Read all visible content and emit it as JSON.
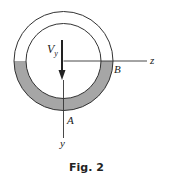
{
  "figure": {
    "caption": "Fig. 2",
    "shear_force_label": "V",
    "shear_force_subscript": "y",
    "axis_z_label": "z",
    "axis_y_label": "y",
    "point_a_label": "A",
    "point_b_label": "B"
  },
  "colors": {
    "line": "#333333",
    "shaded_region": "#a6a6a6",
    "background": "#ffffff"
  }
}
